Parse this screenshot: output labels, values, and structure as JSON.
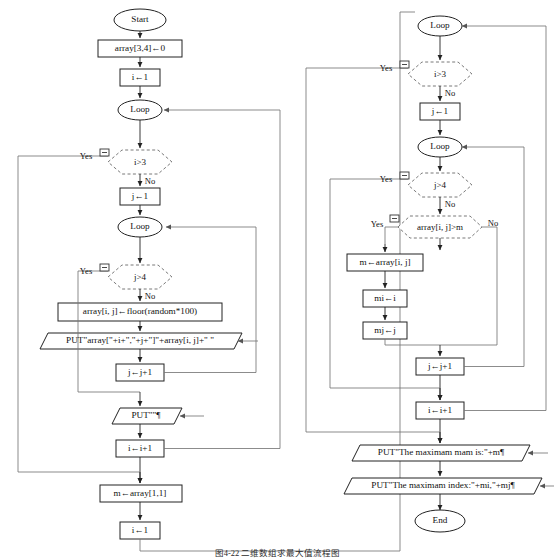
{
  "figure": {
    "caption": "图4-22 二维数组求最大值流程图",
    "type": "flowchart",
    "branch_labels": {
      "yes": "Yes",
      "no": "No"
    },
    "collapse_icon": "minus-box-icon"
  },
  "colors": {
    "stroke": "#222222",
    "dashed_stroke": "#5a5a5a",
    "connector": "#6e6e6e",
    "text": "#111111",
    "background": "#ffffff"
  },
  "left_column": {
    "nodes": [
      {
        "id": "start",
        "kind": "terminator",
        "label": "Start"
      },
      {
        "id": "arr_init",
        "kind": "process",
        "label": "array[3,4]←0"
      },
      {
        "id": "i_init",
        "kind": "process",
        "label": "i←1"
      },
      {
        "id": "loop_outer",
        "kind": "loop",
        "label": "Loop"
      },
      {
        "id": "dec_i_gt3",
        "kind": "decision",
        "label": "i>3"
      },
      {
        "id": "j_init",
        "kind": "process",
        "label": "j←1"
      },
      {
        "id": "loop_inner",
        "kind": "loop",
        "label": "Loop"
      },
      {
        "id": "dec_j_gt4",
        "kind": "decision",
        "label": "j>4"
      },
      {
        "id": "arr_assign",
        "kind": "process",
        "label": "array[i, j]←floor(random*100)"
      },
      {
        "id": "put_cell",
        "kind": "io",
        "label": "PUT\"array[\"+i+\",\"+j+\"]\"+array[i, j]+\"   \""
      },
      {
        "id": "j_inc",
        "kind": "process",
        "label": "j←j+1"
      },
      {
        "id": "put_blank",
        "kind": "io",
        "label": "PUT\"\"¶"
      },
      {
        "id": "i_inc",
        "kind": "process",
        "label": "i←i+1"
      },
      {
        "id": "m_init",
        "kind": "process",
        "label": "m←array[1,1]"
      },
      {
        "id": "i_reset",
        "kind": "process",
        "label": "i←1"
      }
    ]
  },
  "right_column": {
    "nodes": [
      {
        "id": "loop_outer2",
        "kind": "loop",
        "label": "Loop"
      },
      {
        "id": "dec_i_gt3_b",
        "kind": "decision",
        "label": "i>3"
      },
      {
        "id": "j_init_b",
        "kind": "process",
        "label": "j←1"
      },
      {
        "id": "loop_inner2",
        "kind": "loop",
        "label": "Loop"
      },
      {
        "id": "dec_j_gt4_b",
        "kind": "decision",
        "label": "j>4"
      },
      {
        "id": "dec_arr_gt_m",
        "kind": "decision",
        "label": "array[i, j]>m"
      },
      {
        "id": "m_set",
        "kind": "process",
        "label": "m←array[i, j]"
      },
      {
        "id": "mi_set",
        "kind": "process",
        "label": "mi←i"
      },
      {
        "id": "mj_set",
        "kind": "process",
        "label": "mj←j"
      },
      {
        "id": "j_inc_b",
        "kind": "process",
        "label": "j←j+1"
      },
      {
        "id": "i_inc_b",
        "kind": "process",
        "label": "i←i+1"
      },
      {
        "id": "put_max",
        "kind": "io",
        "label": "PUT\"The maximam mam is:\"+m¶"
      },
      {
        "id": "put_index",
        "kind": "io",
        "label": "PUT\"The maximam index:\"+mi,\"+mj¶"
      },
      {
        "id": "end",
        "kind": "terminator",
        "label": "End"
      }
    ]
  },
  "branch_text": {
    "yes_1": "Yes",
    "no_1": "No",
    "yes_2": "Yes",
    "no_2": "No",
    "yes_3": "Yes",
    "no_3": "No",
    "yes_4": "Yes",
    "no_4": "No",
    "yes_5": "Yes",
    "no_5": "No",
    "no_6": "No"
  }
}
